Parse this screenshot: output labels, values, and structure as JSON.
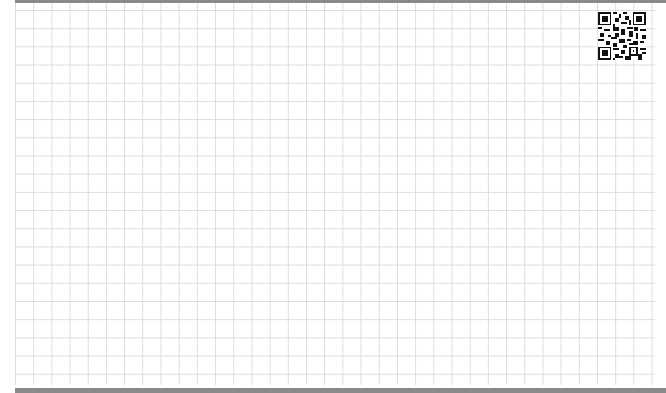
{
  "page": {
    "type": "grid-paper",
    "background_color": "#ffffff",
    "grid_line_color": "#dcdcdc",
    "border_color": "#8a8a8a"
  },
  "qr_code": {
    "icon": "qr-code-icon",
    "position": "top-right"
  }
}
